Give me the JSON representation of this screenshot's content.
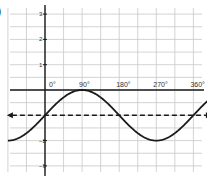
{
  "figure": {
    "partial_label": ")"
  },
  "chart_data": {
    "type": "line",
    "title": "",
    "xlabel": "",
    "ylabel": "",
    "function": "y = sin(x) - 1",
    "x_unit": "degrees",
    "x_tick_labels": [
      "0°",
      "90°",
      "180°",
      "270°",
      "360°"
    ],
    "x_ticks": [
      0,
      90,
      180,
      270,
      360
    ],
    "y_tick_labels": [
      "3",
      "2",
      "1",
      "-2",
      "-3"
    ],
    "y_ticks": [
      3,
      2,
      1,
      -2,
      -3
    ],
    "xlim": [
      -90,
      405
    ],
    "ylim": [
      -3.4,
      3.3
    ],
    "grid": true,
    "grid_x_step": 45,
    "grid_y_step": 0.5,
    "series": [
      {
        "name": "curve",
        "style": "solid",
        "color": "#1a1a1a",
        "x": [
          -90,
          -45,
          0,
          45,
          90,
          135,
          180,
          225,
          270,
          315,
          360,
          400
        ],
        "y": [
          -2,
          -1.71,
          -1,
          -0.29,
          0,
          -0.29,
          -1,
          -1.71,
          -2,
          -1.71,
          -1,
          -0.36
        ]
      },
      {
        "name": "midline",
        "style": "dashed",
        "color": "#1a1a1a",
        "arrows": "both",
        "x": [
          -90,
          400
        ],
        "y": [
          -1,
          -1
        ]
      }
    ],
    "legend": null
  },
  "colors": {
    "grid": "#c8c8c8",
    "axis": "#1a1a1a",
    "curve": "#1a1a1a"
  }
}
